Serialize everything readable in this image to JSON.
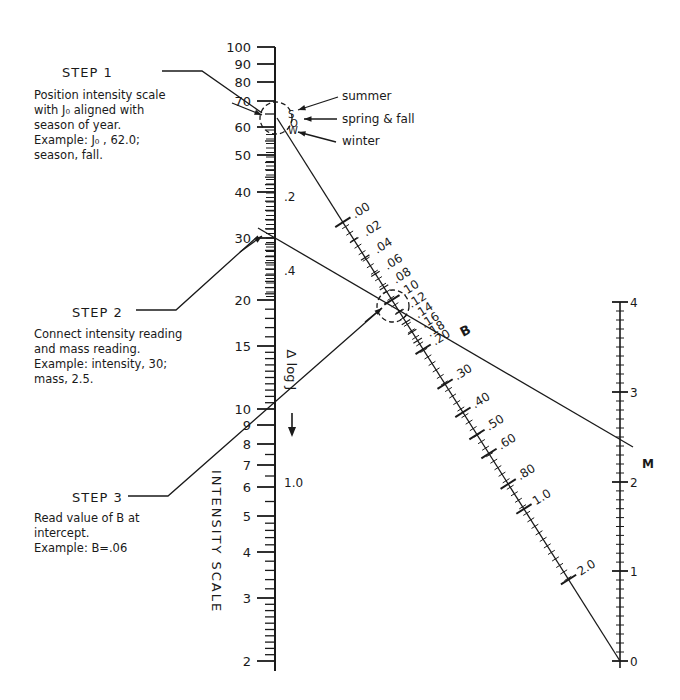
{
  "steps": [
    {
      "title": "STEP 1",
      "lines": "Position intensity scale\nwith J₀ aligned with\nseason of year.\nExample:  J₀ , 62.0;\nseason, fall."
    },
    {
      "title": "STEP 2",
      "lines": "Connect intensity reading\nand mass reading.\nExample: intensity, 30;\nmass, 2.5."
    },
    {
      "title": "STEP 3",
      "lines": "Read value of B at\nintercept.\nExample:  B=.06"
    }
  ],
  "intensity_scale": {
    "label": "INTENSITY  SCALE",
    "major": [
      {
        "v": "100",
        "y": 47
      },
      {
        "v": "90",
        "y": 64
      },
      {
        "v": "80",
        "y": 82
      },
      {
        "v": "70",
        "y": 101
      },
      {
        "v": "60",
        "y": 127
      },
      {
        "v": "50",
        "y": 155
      },
      {
        "v": "40",
        "y": 192
      },
      {
        "v": "30",
        "y": 238
      },
      {
        "v": "20",
        "y": 300
      },
      {
        "v": "15",
        "y": 346
      },
      {
        "v": "10",
        "y": 409
      },
      {
        "v": "9",
        "y": 425
      },
      {
        "v": "8",
        "y": 444
      },
      {
        "v": "7",
        "y": 465
      },
      {
        "v": "6",
        "y": 487
      },
      {
        "v": "5",
        "y": 516
      },
      {
        "v": "4",
        "y": 552
      },
      {
        "v": "3",
        "y": 598
      },
      {
        "v": "2",
        "y": 661
      }
    ],
    "delta_log_j": {
      "label": "Δ  log J",
      "ticks": [
        {
          "v": ".2",
          "y": 196
        },
        {
          "v": ".4",
          "y": 270
        },
        {
          "v": "1.0",
          "y": 482
        }
      ]
    }
  },
  "season_markers": {
    "summer": "summer",
    "spring_fall": "spring & fall",
    "winter": "winter",
    "letters": [
      "S",
      "O",
      "W"
    ]
  },
  "b_scale": {
    "label": "B",
    "ticks": [
      ".00",
      ".02",
      ".04",
      ".06",
      ".08",
      ".10",
      ".12",
      ".14",
      ".16",
      ".18",
      ".20",
      ".30",
      ".40",
      ".50",
      ".60",
      ".80",
      "1.0",
      "2.0"
    ]
  },
  "m_scale": {
    "label": "M",
    "ticks": [
      {
        "v": "4",
        "y": 302
      },
      {
        "v": "3",
        "y": 392
      },
      {
        "v": "2",
        "y": 482
      },
      {
        "v": "1",
        "y": 571
      },
      {
        "v": "0",
        "y": 661
      }
    ]
  },
  "example": {
    "J0": "62.0",
    "season": "fall",
    "intensity": "30",
    "mass": "2.5",
    "B": ".06"
  }
}
